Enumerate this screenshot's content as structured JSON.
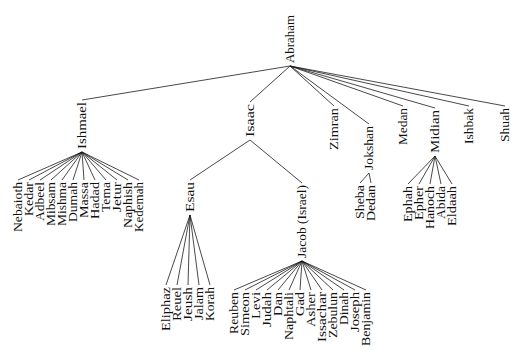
{
  "diagram": {
    "type": "family-tree",
    "root": "Abraham",
    "colors": {
      "line": "#1a1a1a",
      "text": "#111111",
      "background": "#ffffff"
    },
    "nodes": [
      {
        "id": "abraham",
        "label": "Abraham",
        "x": 294,
        "y": 15,
        "len": 48
      },
      {
        "id": "ishmael",
        "label": "Ishmael",
        "x": 86,
        "y": 102,
        "len": 47,
        "parent": "abraham"
      },
      {
        "id": "isaac",
        "label": "Isaac",
        "x": 254,
        "y": 104,
        "len": 33,
        "parent": "abraham"
      },
      {
        "id": "zimran",
        "label": "Zimran",
        "x": 338,
        "y": 108,
        "len": 42,
        "parent": "abraham"
      },
      {
        "id": "jokshan",
        "label": "Jokshan",
        "x": 373,
        "y": 126,
        "len": 44,
        "parent": "abraham"
      },
      {
        "id": "medan",
        "label": "Medan",
        "x": 407,
        "y": 108,
        "len": 37,
        "parent": "abraham"
      },
      {
        "id": "midian",
        "label": "Midian",
        "x": 439,
        "y": 110,
        "len": 43,
        "parent": "abraham"
      },
      {
        "id": "ishbak",
        "label": "Ishbak",
        "x": 473,
        "y": 108,
        "len": 36,
        "parent": "abraham"
      },
      {
        "id": "shuah",
        "label": "Shuah",
        "x": 509,
        "y": 108,
        "len": 34,
        "parent": "abraham"
      },
      {
        "id": "nebaioth",
        "label": "Nebaioth",
        "x": 22,
        "y": 182,
        "len": 50,
        "parent": "ishmael"
      },
      {
        "id": "kedar",
        "label": "Kedar",
        "x": 33,
        "y": 182,
        "len": 34,
        "parent": "ishmael"
      },
      {
        "id": "adbeel",
        "label": "Adbeel",
        "x": 44,
        "y": 182,
        "len": 39,
        "parent": "ishmael"
      },
      {
        "id": "mibsam",
        "label": "Mibsam",
        "x": 55,
        "y": 182,
        "len": 44,
        "parent": "ishmael"
      },
      {
        "id": "mishma",
        "label": "Mishma",
        "x": 66,
        "y": 182,
        "len": 44,
        "parent": "ishmael"
      },
      {
        "id": "dumah",
        "label": "Dumah",
        "x": 77,
        "y": 182,
        "len": 40,
        "parent": "ishmael"
      },
      {
        "id": "massa",
        "label": "Massa",
        "x": 88,
        "y": 182,
        "len": 36,
        "parent": "ishmael"
      },
      {
        "id": "hadad",
        "label": "Hadad",
        "x": 99,
        "y": 182,
        "len": 37,
        "parent": "ishmael"
      },
      {
        "id": "tema",
        "label": "Tema",
        "x": 110,
        "y": 182,
        "len": 30,
        "parent": "ishmael"
      },
      {
        "id": "jetur",
        "label": "Jetur",
        "x": 121,
        "y": 182,
        "len": 30,
        "parent": "ishmael"
      },
      {
        "id": "naphish",
        "label": "Naphish",
        "x": 132,
        "y": 182,
        "len": 46,
        "parent": "ishmael"
      },
      {
        "id": "kedemah",
        "label": "Kedemah",
        "x": 143,
        "y": 182,
        "len": 50,
        "parent": "ishmael"
      },
      {
        "id": "esau",
        "label": "Esau",
        "x": 194,
        "y": 182,
        "len": 30,
        "parent": "isaac"
      },
      {
        "id": "jacob",
        "label": "Jacob (Israel)",
        "x": 306,
        "y": 185,
        "len": 73,
        "parent": "isaac"
      },
      {
        "id": "eliphaz",
        "label": "Eliphaz",
        "x": 170,
        "y": 287,
        "len": 44,
        "parent": "esau"
      },
      {
        "id": "reuel",
        "label": "Reuel",
        "x": 181,
        "y": 287,
        "len": 34,
        "parent": "esau"
      },
      {
        "id": "jeush",
        "label": "Jeush",
        "x": 192,
        "y": 287,
        "len": 34,
        "parent": "esau"
      },
      {
        "id": "jalam",
        "label": "Jalam",
        "x": 203,
        "y": 287,
        "len": 33,
        "parent": "esau"
      },
      {
        "id": "korah",
        "label": "Korah",
        "x": 214,
        "y": 287,
        "len": 34,
        "parent": "esau"
      },
      {
        "id": "reuben",
        "label": "Reuben",
        "x": 238,
        "y": 292,
        "len": 42,
        "parent": "jacob"
      },
      {
        "id": "simeon",
        "label": "Simeon",
        "x": 249,
        "y": 292,
        "len": 44,
        "parent": "jacob"
      },
      {
        "id": "levi",
        "label": "Levi",
        "x": 260,
        "y": 292,
        "len": 27,
        "parent": "jacob"
      },
      {
        "id": "judah",
        "label": "Judah",
        "x": 271,
        "y": 292,
        "len": 35,
        "parent": "jacob"
      },
      {
        "id": "dan",
        "label": "Dan",
        "x": 282,
        "y": 292,
        "len": 24,
        "parent": "jacob"
      },
      {
        "id": "naphtali",
        "label": "Naphtali",
        "x": 293,
        "y": 292,
        "len": 48,
        "parent": "jacob"
      },
      {
        "id": "gad",
        "label": "Gad",
        "x": 304,
        "y": 292,
        "len": 24,
        "parent": "jacob"
      },
      {
        "id": "asher",
        "label": "Asher",
        "x": 315,
        "y": 292,
        "len": 35,
        "parent": "jacob"
      },
      {
        "id": "issachar",
        "label": "Issachar",
        "x": 326,
        "y": 292,
        "len": 50,
        "parent": "jacob"
      },
      {
        "id": "zebulun",
        "label": "Zebulun",
        "x": 337,
        "y": 292,
        "len": 46,
        "parent": "jacob"
      },
      {
        "id": "dinah",
        "label": "Dinah",
        "x": 348,
        "y": 292,
        "len": 33,
        "parent": "jacob"
      },
      {
        "id": "joseph",
        "label": "Joseph",
        "x": 359,
        "y": 292,
        "len": 40,
        "parent": "jacob"
      },
      {
        "id": "benjamin",
        "label": "Benjamin",
        "x": 370,
        "y": 292,
        "len": 54,
        "parent": "jacob"
      },
      {
        "id": "sheba",
        "label": "Sheba",
        "x": 364,
        "y": 185,
        "len": 34,
        "parent": "jokshan"
      },
      {
        "id": "dedan",
        "label": "Dedan",
        "x": 375,
        "y": 185,
        "len": 36,
        "parent": "jokshan"
      },
      {
        "id": "ephah",
        "label": "Ephah",
        "x": 412,
        "y": 186,
        "len": 36,
        "parent": "midian"
      },
      {
        "id": "epher",
        "label": "Epher",
        "x": 423,
        "y": 186,
        "len": 34,
        "parent": "midian"
      },
      {
        "id": "hanoch",
        "label": "Hanoch",
        "x": 434,
        "y": 186,
        "len": 43,
        "parent": "midian"
      },
      {
        "id": "abida",
        "label": "Abida",
        "x": 445,
        "y": 186,
        "len": 33,
        "parent": "midian"
      },
      {
        "id": "eldaah",
        "label": "Eldaah",
        "x": 456,
        "y": 186,
        "len": 40,
        "parent": "midian"
      }
    ]
  }
}
